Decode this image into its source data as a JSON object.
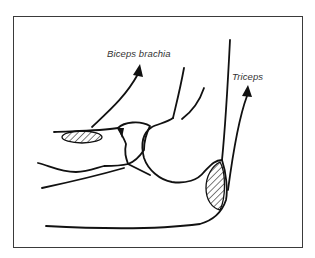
{
  "diagram": {
    "type": "anatomical-line-drawing",
    "labels": [
      {
        "id": "biceps",
        "text": "Biceps brachia"
      },
      {
        "id": "triceps",
        "text": "Triceps"
      }
    ],
    "arrows": [
      {
        "label": "Biceps brachia",
        "direction": "up-right"
      },
      {
        "label": "Triceps",
        "direction": "up"
      }
    ],
    "hatched_regions": [
      {
        "name": "biceps-insertion"
      },
      {
        "name": "triceps-insertion"
      }
    ],
    "colors": {
      "ink": "#111111",
      "frame": "#3a3a3a",
      "background": "#ffffff",
      "label": "#333333"
    }
  }
}
